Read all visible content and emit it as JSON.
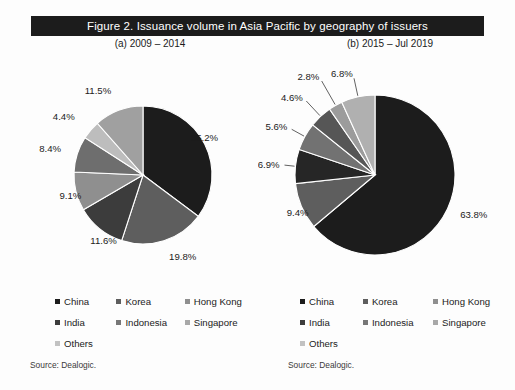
{
  "figure": {
    "title": "Figure 2.  Issuance volume in Asia Pacific by geography of issuers",
    "title_bar_color": "#1c1c1c",
    "title_text_color": "#ffffff",
    "background": "#fdfdfd"
  },
  "panels": {
    "left": {
      "subtitle": "(a) 2009 – 2014",
      "source": "Source: Dealogic."
    },
    "right": {
      "subtitle": "(b) 2015 – Jul 2019",
      "source": "Source: Dealogic."
    }
  },
  "legend": {
    "rows": [
      [
        "China",
        "Korea",
        "Hong Kong"
      ],
      [
        "India",
        "Indonesia",
        "Singapore"
      ],
      [
        "Others",
        "",
        ""
      ]
    ],
    "items": [
      {
        "label": "China",
        "color": "#1c1c1c"
      },
      {
        "label": "Korea",
        "color": "#5e5e5e"
      },
      {
        "label": "Hong Kong",
        "color": "#8f8f8f"
      },
      {
        "label": "India",
        "color": "#3c3c3c"
      },
      {
        "label": "Indonesia",
        "color": "#777777"
      },
      {
        "label": "Singapore",
        "color": "#a8a8a8"
      },
      {
        "label": "Others",
        "color": "#c2c2c2"
      }
    ]
  },
  "chart_data": [
    {
      "type": "pie",
      "title": "(a) 2009 – 2014",
      "categories": [
        "China",
        "Korea",
        "Hong Kong",
        "India",
        "Indonesia",
        "Singapore",
        "Others"
      ],
      "values": [
        35.2,
        19.8,
        11.6,
        9.1,
        8.4,
        4.4,
        11.5
      ],
      "labels": [
        "35.2%",
        "19.8%",
        "11.6%",
        "9.1%",
        "8.4%",
        "4.4%",
        "11.5%"
      ],
      "colors": [
        "#1c1c1c",
        "#5e5e5e",
        "#3c3c3c",
        "#8f8f8f",
        "#6e6e6e",
        "#bdbdbd",
        "#a0a0a0"
      ],
      "legend_position": "bottom",
      "units": "percent"
    },
    {
      "type": "pie",
      "title": "(b) 2015 – Jul 2019",
      "categories": [
        "China",
        "Korea",
        "Hong Kong",
        "India",
        "Indonesia",
        "Singapore",
        "Others"
      ],
      "values": [
        63.8,
        9.4,
        6.9,
        5.6,
        4.6,
        2.8,
        6.8
      ],
      "labels": [
        "63.8%",
        "9.4%",
        "6.9%",
        "5.6%",
        "4.6%",
        "2.8%",
        "6.8%"
      ],
      "colors": [
        "#1c1c1c",
        "#5e5e5e",
        "#262626",
        "#727272",
        "#565656",
        "#9c9c9c",
        "#b0b0b0"
      ],
      "legend_position": "bottom",
      "units": "percent"
    }
  ]
}
